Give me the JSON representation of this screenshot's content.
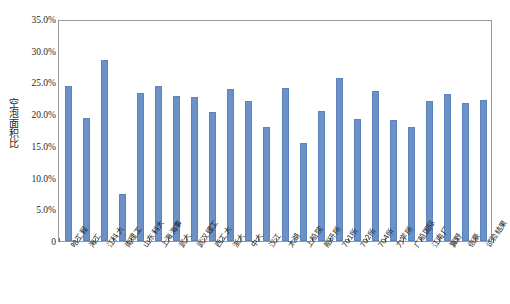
{
  "chart_data": {
    "type": "bar",
    "title": "",
    "xlabel": "",
    "ylabel": "空泡面积比",
    "ylim": [
      0,
      0.35
    ],
    "grid": false,
    "legend": null,
    "y_tick_labels": [
      "35.0%",
      "30.0%",
      "25.0%",
      "20.0%",
      "15.0%",
      "10.0%",
      "5.0%",
      "0"
    ],
    "y_tick_values": [
      0.35,
      0.3,
      0.25,
      0.2,
      0.15,
      0.1,
      0.05,
      0.0
    ],
    "categories": [
      "哈工程",
      "海工",
      "江科大",
      "南理工",
      "山东科大",
      "上海海事",
      "武大",
      "武汉理工",
      "西工大",
      "浙大",
      "中大",
      "汉江",
      "太湖",
      "上船院",
      "船研所",
      "701所",
      "702所",
      "704所",
      "力学所",
      "广船国际",
      "江南厂",
      "翼野",
      "倍豪",
      "试验结果"
    ],
    "values": [
      0.245,
      0.194,
      0.286,
      0.074,
      0.234,
      0.244,
      0.228,
      0.227,
      0.203,
      0.24,
      0.22,
      0.179,
      0.241,
      0.155,
      0.205,
      0.257,
      0.192,
      0.236,
      0.191,
      0.18,
      0.22,
      0.232,
      0.217,
      0.222
    ],
    "series": [
      {
        "name": "空泡面积比",
        "values": [
          0.245,
          0.194,
          0.286,
          0.074,
          0.234,
          0.244,
          0.228,
          0.227,
          0.203,
          0.24,
          0.22,
          0.179,
          0.241,
          0.155,
          0.205,
          0.257,
          0.192,
          0.236,
          0.191,
          0.18,
          0.22,
          0.232,
          0.217,
          0.222
        ],
        "color": "#6c91c6"
      }
    ],
    "bar_color": "#6c91c6",
    "bar_border_color": "#5b83bd",
    "axis_color": "#9a9a9a",
    "background": "#ffffff"
  }
}
